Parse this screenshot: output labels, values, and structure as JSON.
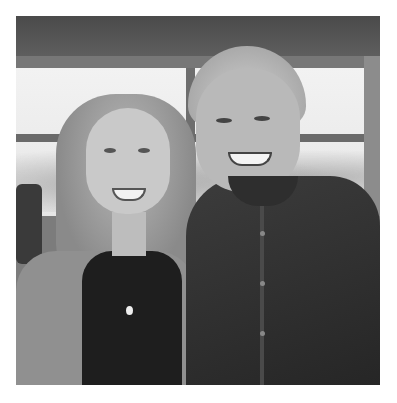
{
  "image": {
    "description": "Black-and-white photo of a smiling woman with long light hair and a man with grey hair in a dark button-up shirt posing together in front of a window",
    "style": "grayscale photograph",
    "subjects": [
      {
        "label": "woman",
        "position": "left",
        "attire": "light jacket, dark top, pendant necklace"
      },
      {
        "label": "man",
        "position": "right",
        "attire": "dark button-up shirt"
      }
    ],
    "background": "large window with mullions, trees outside, dark ceiling band"
  },
  "colors": {
    "frame": "#ffffff",
    "ceiling": "#4a4a4a",
    "window": "#eeeeee",
    "shirt": "#2c2c2c"
  }
}
